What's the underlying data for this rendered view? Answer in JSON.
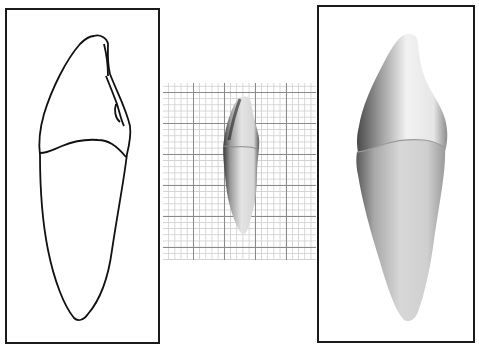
{
  "figure": {
    "panels": [
      {
        "id": "outline-drawing",
        "description": "line drawing of tooth outline"
      },
      {
        "id": "photo-on-grid",
        "description": "photograph of tooth on graph paper"
      },
      {
        "id": "shaded-rendering",
        "description": "shaded rendering of tooth"
      }
    ],
    "colors": {
      "frame": "#1a1a1a",
      "grid_major": "#8a8a8a",
      "grid_minor": "#d2d2d2",
      "background": "#ffffff"
    }
  }
}
